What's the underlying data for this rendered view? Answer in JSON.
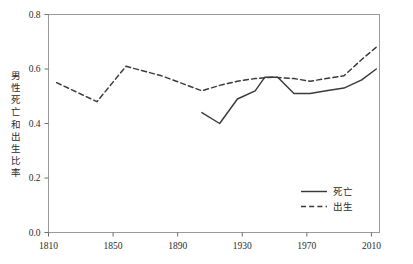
{
  "chart_data": {
    "type": "line",
    "title": "",
    "xlabel": "",
    "ylabel": "男性死亡和出生比率",
    "xlim": [
      1810,
      2015
    ],
    "ylim": [
      0.0,
      0.8
    ],
    "grid": false,
    "legend_position": "bottom-right inside plot",
    "x_ticks": [
      "1810",
      "1850",
      "1890",
      "1930",
      "1970",
      "2010"
    ],
    "x_tick_values": [
      1810,
      1850,
      1890,
      1930,
      1970,
      2010
    ],
    "y_ticks": [
      "0.0",
      "0.2",
      "0.4",
      "0.6",
      "0.8"
    ],
    "y_tick_values": [
      0.0,
      0.2,
      0.4,
      0.6,
      0.8
    ],
    "series": [
      {
        "name": "死亡",
        "style": "solid",
        "color": "#3a3a3a",
        "x": [
          1905,
          1916,
          1927,
          1938,
          1944,
          1952,
          1962,
          1972,
          1982,
          1993,
          2004,
          2013
        ],
        "values": [
          0.44,
          0.4,
          0.49,
          0.52,
          0.57,
          0.57,
          0.51,
          0.51,
          0.52,
          0.53,
          0.56,
          0.6
        ]
      },
      {
        "name": "出生",
        "style": "dashed",
        "color": "#3a3a3a",
        "x": [
          1815,
          1840,
          1858,
          1880,
          1905,
          1916,
          1927,
          1938,
          1949,
          1962,
          1972,
          1982,
          1993,
          2004,
          2013
        ],
        "values": [
          0.55,
          0.48,
          0.61,
          0.575,
          0.52,
          0.54,
          0.555,
          0.565,
          0.57,
          0.565,
          0.555,
          0.565,
          0.575,
          0.635,
          0.68
        ]
      }
    ]
  },
  "axis": {
    "y_title": "男性死亡和出生比率",
    "y_tick_labels": [
      "0.8",
      "0.6",
      "0.4",
      "0.2",
      "0.0"
    ],
    "x_tick_labels": [
      "1810",
      "1850",
      "1890",
      "1930",
      "1970",
      "2010"
    ]
  },
  "legend": {
    "entries": [
      {
        "label": "死亡",
        "style": "solid"
      },
      {
        "label": "出生",
        "style": "dashed"
      }
    ]
  }
}
